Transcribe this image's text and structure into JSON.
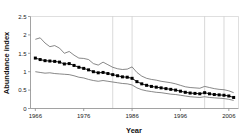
{
  "chart_data": {
    "type": "line",
    "title": "",
    "xlabel": "Year",
    "ylabel": "Abundance index",
    "xlim": [
      1965,
      2008
    ],
    "ylim": [
      0,
      2.5
    ],
    "grid": "vertical-only",
    "legend": "none",
    "x_ticks": [
      1966,
      1976,
      1986,
      1996,
      2006
    ],
    "x_tick_labels": [
      "1966",
      "1976",
      "1986",
      "1996",
      "2006"
    ],
    "y_ticks": [
      0,
      0.5,
      1,
      1.5,
      2,
      2.5
    ],
    "y_tick_labels": [
      "0",
      "0.5",
      "1",
      "1.5",
      "2",
      "2.5"
    ],
    "vertical_gridlines": [
      1982,
      1986,
      2001,
      2005
    ],
    "x": [
      1966,
      1967,
      1968,
      1969,
      1970,
      1971,
      1972,
      1973,
      1974,
      1975,
      1976,
      1977,
      1978,
      1979,
      1980,
      1981,
      1982,
      1983,
      1984,
      1985,
      1986,
      1987,
      1988,
      1989,
      1990,
      1991,
      1992,
      1993,
      1994,
      1995,
      1996,
      1997,
      1998,
      1999,
      2000,
      2001,
      2002,
      2003,
      2004,
      2005,
      2006,
      2007
    ],
    "series": [
      {
        "name": "Abundance index",
        "style": "line-with-filled-square-markers",
        "color": "#000000",
        "values": [
          1.37,
          1.33,
          1.3,
          1.29,
          1.28,
          1.26,
          1.21,
          1.22,
          1.17,
          1.12,
          1.09,
          1.05,
          1.0,
          0.97,
          0.98,
          0.95,
          0.92,
          0.89,
          0.86,
          0.85,
          0.82,
          0.73,
          0.67,
          0.63,
          0.6,
          0.58,
          0.56,
          0.54,
          0.52,
          0.5,
          0.47,
          0.44,
          0.42,
          0.41,
          0.4,
          0.43,
          0.4,
          0.38,
          0.37,
          0.36,
          0.34,
          0.3
        ]
      },
      {
        "name": "Upper confidence limit",
        "style": "thin-line",
        "color": "#555555",
        "values": [
          1.88,
          1.92,
          1.78,
          1.68,
          1.71,
          1.64,
          1.5,
          1.55,
          1.45,
          1.37,
          1.36,
          1.33,
          1.22,
          1.18,
          1.26,
          1.19,
          1.12,
          1.08,
          1.06,
          1.07,
          1.13,
          0.98,
          0.88,
          0.82,
          0.79,
          0.77,
          0.74,
          0.72,
          0.7,
          0.67,
          0.63,
          0.59,
          0.57,
          0.56,
          0.55,
          0.6,
          0.57,
          0.54,
          0.52,
          0.51,
          0.48,
          0.43
        ]
      },
      {
        "name": "Lower confidence limit",
        "style": "thin-line",
        "color": "#555555",
        "values": [
          1.0,
          0.98,
          0.96,
          0.97,
          0.95,
          0.94,
          0.93,
          0.92,
          0.89,
          0.85,
          0.83,
          0.79,
          0.76,
          0.74,
          0.76,
          0.74,
          0.72,
          0.7,
          0.68,
          0.67,
          0.64,
          0.56,
          0.51,
          0.48,
          0.46,
          0.44,
          0.43,
          0.41,
          0.39,
          0.38,
          0.36,
          0.34,
          0.32,
          0.31,
          0.3,
          0.32,
          0.3,
          0.29,
          0.28,
          0.27,
          0.25,
          0.22
        ]
      }
    ]
  },
  "axes": {
    "y_title": "Abundance index",
    "x_title": "Year"
  },
  "colors": {
    "axis": "#8a8a8a",
    "grid": "#bfbfbf",
    "series": "#000000",
    "ci": "#555555",
    "text": "#111111"
  }
}
